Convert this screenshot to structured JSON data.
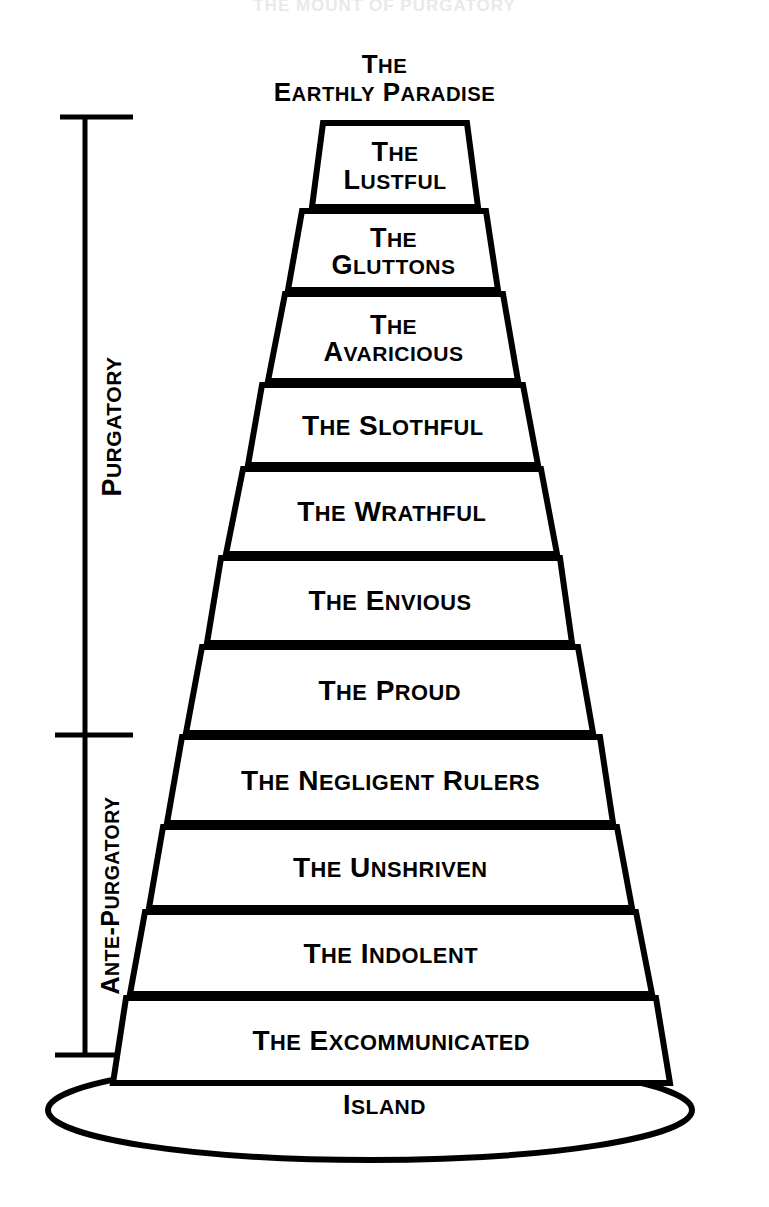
{
  "page": {
    "title": "The Mount of Purgatory",
    "cut_off_top_text": "THE MOUNT OF PURGATORY",
    "background_color": "#ffffff",
    "ink_color": "#000000"
  },
  "apex": {
    "line1": "The",
    "line2": "Earthly Paradise"
  },
  "brackets": [
    {
      "id": "purgatory",
      "label": "Purgatory",
      "top_y": 117,
      "bottom_y": 735
    },
    {
      "id": "ante-purgatory",
      "label": "Ante-Purgatory",
      "top_y": 735,
      "bottom_y": 1055
    }
  ],
  "base": {
    "label": "Island"
  },
  "chart_data": {
    "type": "diagram",
    "title": "The Mount of Purgatory",
    "shape": "stepped truncated cone / ziggurat",
    "orientation": "apex at top, widest tier at bottom",
    "tier_count": 11,
    "tiers": [
      {
        "index": 1,
        "lines": [
          "The",
          "Lustful"
        ],
        "text": "The Lustful",
        "group": "Purgatory",
        "top_y": 123,
        "bottom_y": 207,
        "top_left_x": 323,
        "top_right_x": 467,
        "bottom_left_x": 312,
        "bottom_right_x": 478,
        "font_size": 27
      },
      {
        "index": 2,
        "lines": [
          "The",
          "Gluttons"
        ],
        "text": "The Gluttons",
        "group": "Purgatory",
        "top_y": 211,
        "bottom_y": 290,
        "top_left_x": 302,
        "top_right_x": 486,
        "bottom_left_x": 288,
        "bottom_right_x": 498,
        "font_size": 27
      },
      {
        "index": 3,
        "lines": [
          "The",
          "Avaricious"
        ],
        "text": "The Avaricious",
        "group": "Purgatory",
        "top_y": 294,
        "bottom_y": 381,
        "top_left_x": 285,
        "top_right_x": 503,
        "bottom_left_x": 268,
        "bottom_right_x": 518,
        "font_size": 27
      },
      {
        "index": 4,
        "lines": [
          "The Slothful"
        ],
        "text": "The Slothful",
        "group": "Purgatory",
        "top_y": 385,
        "bottom_y": 465,
        "top_left_x": 262,
        "top_right_x": 523,
        "bottom_left_x": 248,
        "bottom_right_x": 538,
        "font_size": 28
      },
      {
        "index": 5,
        "lines": [
          "The Wrathful"
        ],
        "text": "The Wrathful",
        "group": "Purgatory",
        "top_y": 469,
        "bottom_y": 554,
        "top_left_x": 243,
        "top_right_x": 541,
        "bottom_left_x": 226,
        "bottom_right_x": 557,
        "font_size": 28
      },
      {
        "index": 6,
        "lines": [
          "The Envious"
        ],
        "text": "The Envious",
        "group": "Purgatory",
        "top_y": 558,
        "bottom_y": 643,
        "top_left_x": 221,
        "top_right_x": 560,
        "bottom_left_x": 207,
        "bottom_right_x": 572,
        "font_size": 28
      },
      {
        "index": 7,
        "lines": [
          "The Proud"
        ],
        "text": "The Proud",
        "group": "Purgatory",
        "top_y": 647,
        "bottom_y": 733,
        "top_left_x": 202,
        "top_right_x": 578,
        "bottom_left_x": 186,
        "bottom_right_x": 593,
        "font_size": 28
      },
      {
        "index": 8,
        "lines": [
          "The Negligent Rulers"
        ],
        "text": "The Negligent Rulers",
        "group": "Ante-Purgatory",
        "top_y": 737,
        "bottom_y": 823,
        "top_left_x": 182,
        "top_right_x": 600,
        "bottom_left_x": 167,
        "bottom_right_x": 613,
        "font_size": 28
      },
      {
        "index": 9,
        "lines": [
          "The Unshriven"
        ],
        "text": "The Unshriven",
        "group": "Ante-Purgatory",
        "top_y": 827,
        "bottom_y": 908,
        "top_left_x": 163,
        "top_right_x": 617,
        "bottom_left_x": 149,
        "bottom_right_x": 632,
        "font_size": 28
      },
      {
        "index": 10,
        "lines": [
          "The Indolent"
        ],
        "text": "The Indolent",
        "group": "Ante-Purgatory",
        "top_y": 912,
        "bottom_y": 994,
        "top_left_x": 145,
        "top_right_x": 636,
        "bottom_left_x": 130,
        "bottom_right_x": 652,
        "font_size": 28
      },
      {
        "index": 11,
        "lines": [
          "The Excommunicated"
        ],
        "text": "The Excommunicated",
        "group": "Ante-Purgatory",
        "top_y": 998,
        "bottom_y": 1083,
        "top_left_x": 126,
        "top_right_x": 656,
        "bottom_left_x": 113,
        "bottom_right_x": 670,
        "font_size": 28
      }
    ],
    "island": {
      "label": "Island",
      "center_x": 370,
      "center_y": 1110,
      "radius_x": 322,
      "radius_y": 50
    },
    "axis_labels": [
      "Purgatory",
      "Ante-Purgatory"
    ],
    "legend": []
  }
}
